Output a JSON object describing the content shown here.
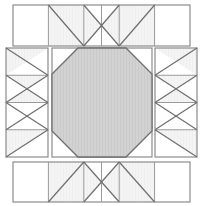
{
  "diagram": {
    "type": "quilt-block-piecing-diagram",
    "canvas": {
      "width": 201,
      "height": 206
    },
    "colors": {
      "background": "#ffffff",
      "patch_light": "#ffffff",
      "patch_shade": "#f4f4f4",
      "patch_fill_center": "#d2d2d2",
      "outline": "#8c8c8c",
      "seam_line": "#9a9a9a",
      "diagonal_line": "#6e6e6e"
    },
    "line_weights": {
      "outline": 1.2,
      "seam": 1.0,
      "diagonal": 1.2
    },
    "sections": [
      {
        "name": "top-strip",
        "label": "Top border strip",
        "x": 13,
        "y": 5,
        "width": 177,
        "height": 41,
        "cells": 5,
        "cell_patterns": [
          "plain",
          "half-square-right",
          "hourglass-left",
          "hourglass-right",
          "plain"
        ]
      },
      {
        "name": "left-strip",
        "label": "Left border strip",
        "x": 6,
        "y": 48,
        "width": 42,
        "height": 109,
        "cells": 4,
        "cell_patterns": [
          "half-square-down",
          "hourglass-up",
          "hourglass-down",
          "half-square-up"
        ]
      },
      {
        "name": "center-block",
        "label": "Center octagon block",
        "x": 52,
        "y": 48,
        "width": 100,
        "height": 109,
        "shape": "octagon",
        "corner_cut": 26
      },
      {
        "name": "right-strip",
        "label": "Right border strip",
        "x": 155,
        "y": 48,
        "width": 42,
        "height": 109,
        "cells": 4,
        "cell_patterns": [
          "half-square-down",
          "hourglass-up",
          "hourglass-down",
          "half-square-up"
        ]
      },
      {
        "name": "bottom-strip",
        "label": "Bottom border strip",
        "x": 13,
        "y": 162,
        "width": 177,
        "height": 40,
        "cells": 5,
        "cell_patterns": [
          "plain",
          "half-square-right",
          "hourglass-left",
          "hourglass-right",
          "plain"
        ]
      }
    ]
  }
}
